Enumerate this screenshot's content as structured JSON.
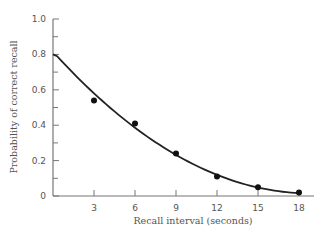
{
  "chart_data": {
    "type": "scatter",
    "title": "",
    "xlabel": "Recall interval (seconds)",
    "ylabel": "Probability of correct recall",
    "xlim": [
      0,
      19
    ],
    "ylim": [
      0,
      1.0
    ],
    "x_ticks": [
      "3",
      "6",
      "9",
      "12",
      "15",
      "18"
    ],
    "y_ticks": [
      "0",
      "0.2",
      "0.4",
      "0.6",
      "0.8",
      "1.0"
    ],
    "grid": false,
    "legend": null,
    "series": [
      {
        "name": "Observed recall",
        "type": "scatter",
        "x": [
          3,
          6,
          9,
          12,
          15,
          18
        ],
        "y": [
          0.54,
          0.41,
          0.24,
          0.11,
          0.05,
          0.02
        ]
      },
      {
        "name": "Fitted curve",
        "type": "line",
        "x": [
          0,
          3,
          6,
          9,
          12,
          15,
          18
        ],
        "y": [
          0.8,
          0.56,
          0.37,
          0.22,
          0.11,
          0.04,
          0.02
        ]
      }
    ],
    "colors": {
      "axis": "#777777",
      "data": "#111111",
      "text": "#555555"
    }
  }
}
